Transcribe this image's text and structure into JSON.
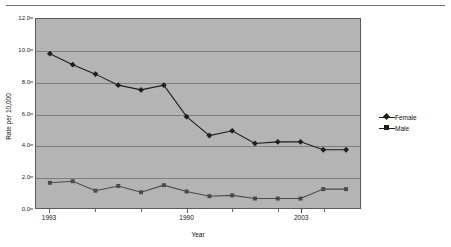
{
  "chart_data": {
    "type": "line",
    "title": "",
    "xlabel": "Year",
    "ylabel": "Rate per 10,000",
    "ylim": [
      0.0,
      12.0
    ],
    "yticks": [
      "0.0",
      "2.0",
      "4.0",
      "6.0",
      "8.0",
      "10.0",
      "12.0"
    ],
    "ytick_values": [
      0.0,
      2.0,
      4.0,
      6.0,
      8.0,
      10.0,
      12.0
    ],
    "grid": "horizontal",
    "legend_position": "right",
    "x": [
      1,
      2,
      3,
      4,
      5,
      6,
      7,
      8,
      9,
      10,
      11,
      12,
      13,
      14
    ],
    "xtick_labels": [
      "1993",
      "1990",
      "2003"
    ],
    "xtick_positions": [
      1,
      7,
      12
    ],
    "categories": [
      "1993",
      "",
      "",
      "",
      "",
      "",
      "1990",
      "",
      "",
      "",
      "",
      "2003",
      "",
      ""
    ],
    "series": [
      {
        "name": "Female",
        "marker": "diamond",
        "color": "#1f1f1f",
        "values": [
          9.8,
          9.1,
          8.5,
          7.8,
          7.5,
          7.8,
          5.8,
          4.6,
          4.9,
          4.1,
          4.2,
          4.2,
          3.7,
          3.7
        ]
      },
      {
        "name": "Male",
        "marker": "square",
        "color": "#4a4a4a",
        "values": [
          1.6,
          1.7,
          1.1,
          1.4,
          1.0,
          1.45,
          1.05,
          0.75,
          0.8,
          0.6,
          0.6,
          0.6,
          1.2,
          1.2
        ]
      }
    ]
  },
  "legend": {
    "items": [
      {
        "label": "Female"
      },
      {
        "label": "Male"
      }
    ]
  },
  "axes": {
    "y_title": "Rate per 10,000",
    "x_title": "Year"
  }
}
